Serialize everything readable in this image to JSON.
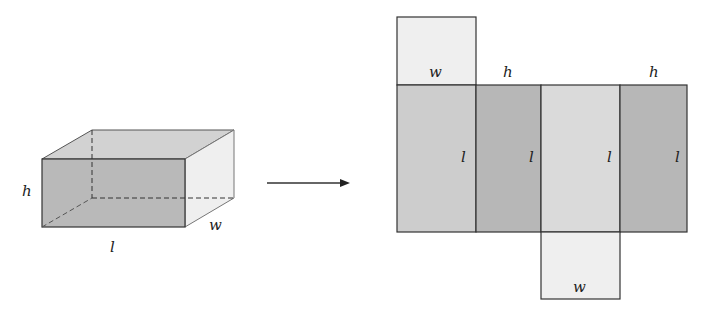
{
  "diagram": {
    "prism": {
      "labels": {
        "height": "h",
        "length": "l",
        "width": "w"
      }
    },
    "arrow": {
      "direction": "right"
    },
    "net": {
      "top_face_label": "w",
      "side_labels_top": [
        "h",
        "h"
      ],
      "strip_labels": [
        "l",
        "l",
        "l",
        "l"
      ],
      "bottom_face_label": "w"
    },
    "colors": {
      "dark_face": "#b9b9b9",
      "mid_face": "#cdcdcd",
      "light_face": "#ececec",
      "edge": "#333333"
    }
  }
}
